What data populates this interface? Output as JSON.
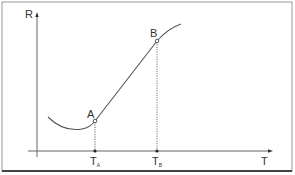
{
  "diagram": {
    "type": "line",
    "axes": {
      "y_label": "R",
      "x_label": "T"
    },
    "points": {
      "A": {
        "label": "A"
      },
      "B": {
        "label": "B"
      }
    },
    "ticks": {
      "TA": {
        "main": "T",
        "sub": "A"
      },
      "TB": {
        "main": "T",
        "sub": "B"
      }
    },
    "colors": {
      "line": "#555555",
      "frame": "#888888",
      "frame_bottom": "#444444"
    }
  }
}
